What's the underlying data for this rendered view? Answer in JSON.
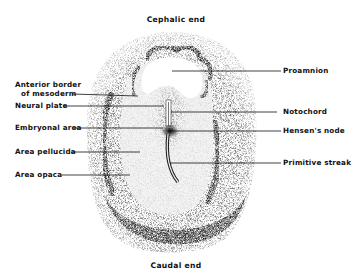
{
  "figure": {
    "orientation_labels": {
      "top": "Cephalic end",
      "bottom": "Caudal end"
    },
    "left_labels": [
      {
        "id": "anterior-border-of-mesoderm",
        "line1": "Anterior border",
        "line2": "of mesoderm"
      },
      {
        "id": "neural-plate",
        "line1": "Neural plate"
      },
      {
        "id": "embryonal-area",
        "line1": "Embryonal area"
      },
      {
        "id": "area-pellucida",
        "line1": "Area pellucida"
      },
      {
        "id": "area-opaca",
        "line1": "Area opaca"
      }
    ],
    "right_labels": [
      {
        "id": "proamnion",
        "line1": "Proamnion"
      },
      {
        "id": "notochord",
        "line1": "Notochord"
      },
      {
        "id": "hensens-node",
        "line1": "Hensen's node"
      },
      {
        "id": "primitive-streak",
        "line1": "Primitive streak"
      }
    ],
    "colors": {
      "ink": "#111111",
      "background": "#ffffff",
      "stipple_dark": "#2a2a2a",
      "stipple_light": "#9a9a9a"
    }
  }
}
